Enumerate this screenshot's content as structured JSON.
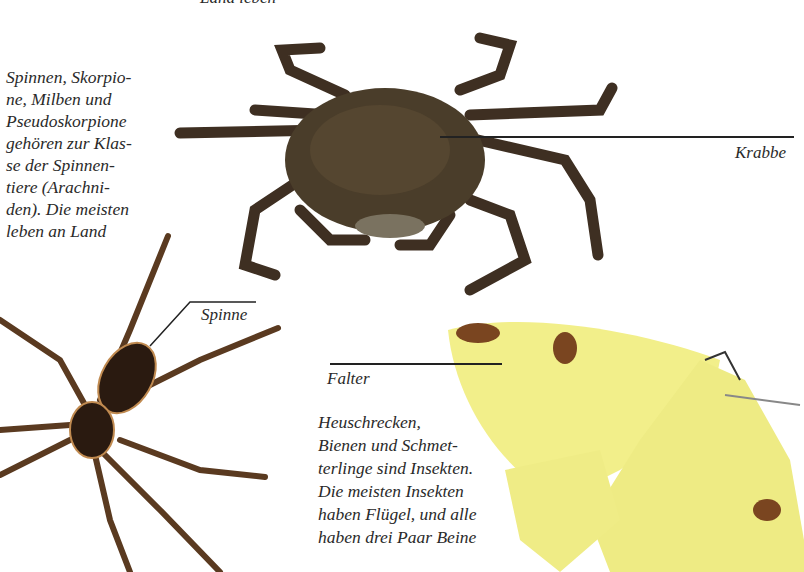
{
  "page": {
    "top_fragment": "Land leben",
    "arachnid_paragraph": "Spinnen, Skorpio-\nne, Milben und\nPseudoskorpione\ngehören zur Klas-\nse der Spinnen-\ntiere (Arachni-\nden). Die meisten\nleben an Land",
    "insect_paragraph": "Heuschrecken,\nBienen und Schmet-\nterlinge sind Insekten.\nDie meisten Insekten\nhaben Flügel, und alle\nhaben drei Paar Beine",
    "labels": {
      "crab": "Krabbe",
      "spider": "Spinne",
      "moth": "Falter"
    }
  },
  "images": {
    "crab": {
      "name": "crab-photo",
      "body_color": "#4a3d2a",
      "leg_color": "#3e2f22"
    },
    "spider": {
      "name": "spider-photo",
      "body_color": "#2a1a10",
      "stripe_color": "#c08a50",
      "leg_color": "#5a3a20"
    },
    "moth": {
      "name": "moth-photo",
      "wing_color": "#f2ef8a",
      "spot_color": "#7a4520"
    }
  }
}
